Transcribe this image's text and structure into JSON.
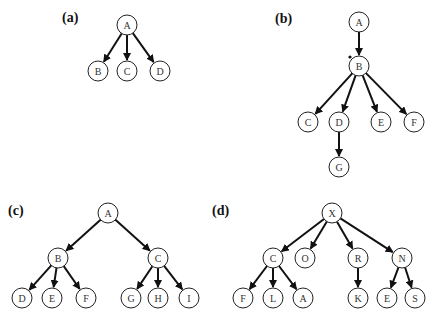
{
  "panels": [
    {
      "id": "a",
      "label": "(a)",
      "label_pos": [
        62,
        22
      ],
      "nodes": [
        {
          "id": "A",
          "x": 127,
          "y": 25
        },
        {
          "id": "B",
          "x": 98,
          "y": 71
        },
        {
          "id": "C",
          "x": 127,
          "y": 71
        },
        {
          "id": "D",
          "x": 160,
          "y": 71
        }
      ],
      "edges": [
        [
          "A",
          "B"
        ],
        [
          "A",
          "C"
        ],
        [
          "A",
          "D"
        ]
      ]
    },
    {
      "id": "b",
      "label": "(b)",
      "label_pos": [
        275,
        23
      ],
      "nodes": [
        {
          "id": "A",
          "x": 359,
          "y": 22
        },
        {
          "id": "B",
          "x": 359,
          "y": 66
        },
        {
          "id": "C",
          "x": 308,
          "y": 122
        },
        {
          "id": "D",
          "x": 339,
          "y": 122
        },
        {
          "id": "E",
          "x": 381,
          "y": 122
        },
        {
          "id": "F",
          "x": 414,
          "y": 122
        },
        {
          "id": "G",
          "x": 339,
          "y": 167
        }
      ],
      "edges": [
        [
          "A",
          "B"
        ],
        [
          "B",
          "C"
        ],
        [
          "B",
          "D"
        ],
        [
          "B",
          "E"
        ],
        [
          "B",
          "F"
        ],
        [
          "D",
          "G"
        ]
      ],
      "marks": [
        {
          "x": 350,
          "y": 57,
          "r": 1.6
        }
      ]
    },
    {
      "id": "c",
      "label": "(c)",
      "label_pos": [
        8,
        215
      ],
      "nodes": [
        {
          "id": "A",
          "x": 108,
          "y": 213
        },
        {
          "id": "B",
          "x": 58,
          "y": 258
        },
        {
          "id": "C",
          "x": 158,
          "y": 258
        },
        {
          "id": "D",
          "x": 22,
          "y": 298
        },
        {
          "id": "E",
          "x": 52,
          "y": 298
        },
        {
          "id": "F",
          "x": 86,
          "y": 298
        },
        {
          "id": "G",
          "x": 131,
          "y": 298
        },
        {
          "id": "H",
          "x": 158,
          "y": 298
        },
        {
          "id": "I",
          "x": 189,
          "y": 298
        }
      ],
      "edges": [
        [
          "A",
          "B"
        ],
        [
          "A",
          "C"
        ],
        [
          "B",
          "D"
        ],
        [
          "B",
          "E"
        ],
        [
          "B",
          "F"
        ],
        [
          "C",
          "G"
        ],
        [
          "C",
          "H"
        ],
        [
          "C",
          "I"
        ]
      ]
    },
    {
      "id": "d",
      "label": "(d)",
      "label_pos": [
        212,
        215
      ],
      "nodes": [
        {
          "id": "X",
          "x": 332,
          "y": 213
        },
        {
          "id": "C",
          "x": 273,
          "y": 258
        },
        {
          "id": "O",
          "x": 305,
          "y": 258
        },
        {
          "id": "R",
          "x": 358,
          "y": 258
        },
        {
          "id": "N",
          "x": 402,
          "y": 258
        },
        {
          "id": "F",
          "x": 243,
          "y": 298
        },
        {
          "id": "L",
          "x": 273,
          "y": 298
        },
        {
          "id": "A",
          "x": 303,
          "y": 298
        },
        {
          "id": "K",
          "x": 358,
          "y": 298
        },
        {
          "id": "E",
          "x": 387,
          "y": 298
        },
        {
          "id": "S",
          "x": 415,
          "y": 298
        }
      ],
      "edges": [
        [
          "X",
          "C"
        ],
        [
          "X",
          "O"
        ],
        [
          "X",
          "R"
        ],
        [
          "X",
          "N"
        ],
        [
          "C",
          "F"
        ],
        [
          "C",
          "L"
        ],
        [
          "C",
          "A"
        ],
        [
          "R",
          "K"
        ],
        [
          "N",
          "E"
        ],
        [
          "N",
          "S"
        ]
      ]
    }
  ],
  "style": {
    "node_radius": 10,
    "stroke_color": "#111111",
    "node_fill": "#ffffff"
  }
}
